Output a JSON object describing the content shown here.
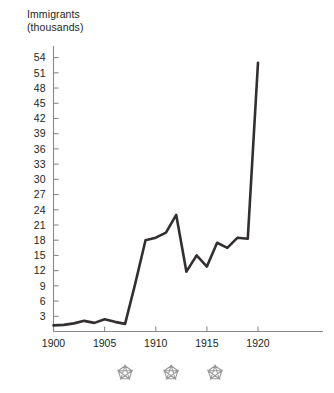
{
  "chart_data": {
    "type": "line",
    "title_line1": "Immigrants",
    "title_line2": "(thousands)",
    "xlabel": "",
    "ylabel": "Immigrants (thousands)",
    "x": [
      1900,
      1901,
      1902,
      1903,
      1904,
      1905,
      1906,
      1907,
      1908,
      1909,
      1910,
      1911,
      1912,
      1913,
      1914,
      1915,
      1916,
      1917,
      1918,
      1919,
      1920
    ],
    "values": [
      1.2,
      1.3,
      1.6,
      2.1,
      1.7,
      2.4,
      1.9,
      1.5,
      9.5,
      18.0,
      18.5,
      19.5,
      23.0,
      11.8,
      15.0,
      12.8,
      17.5,
      16.5,
      18.5,
      18.3,
      53.0
    ],
    "series": [
      {
        "name": "Immigrants",
        "values": [
          1.2,
          1.3,
          1.6,
          2.1,
          1.7,
          2.4,
          1.9,
          1.5,
          9.5,
          18.0,
          18.5,
          19.5,
          23.0,
          11.8,
          15.0,
          12.8,
          17.5,
          16.5,
          18.5,
          18.3,
          53.0
        ]
      }
    ],
    "ylim": [
      0,
      55.5
    ],
    "xlim": [
      1899.5,
      1921.5
    ],
    "yticks": [
      3,
      6,
      9,
      12,
      15,
      18,
      21,
      24,
      27,
      30,
      33,
      36,
      39,
      42,
      45,
      48,
      51,
      54
    ],
    "ytick_labels": [
      "3",
      "6",
      "9",
      "12",
      "15",
      "18",
      "21",
      "24",
      "27",
      "30",
      "33",
      "36",
      "39",
      "42",
      "45",
      "48",
      "51",
      "54"
    ],
    "xticks": [
      1900,
      1905,
      1910,
      1915,
      1920
    ],
    "xtick_labels": [
      "1900",
      "1905",
      "1910",
      "1915",
      "1920"
    ],
    "grid": false,
    "legend": "none",
    "line_color": "#332f2f",
    "axis_color": "#8a8a8a",
    "star_color": "#9a9a9a",
    "annotations": [
      {
        "name": "star-marker",
        "x": 1907,
        "label": "*"
      },
      {
        "name": "star-marker",
        "x": 1911.5,
        "label": "*"
      },
      {
        "name": "star-marker",
        "x": 1915.8,
        "label": "*"
      }
    ]
  }
}
